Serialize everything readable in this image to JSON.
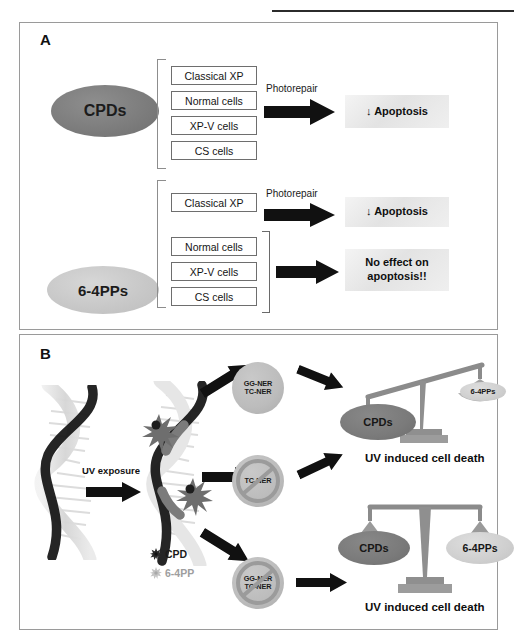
{
  "figure": {
    "header_note": "",
    "panel_a": {
      "letter": "A",
      "row1": {
        "source_label": "CPDs",
        "cells": [
          "Classical  XP",
          "Normal cells",
          "XP-V cells",
          "CS cells"
        ],
        "process_label": "Photorepair",
        "outcome": "↓ Apoptosis",
        "arrow_icon": "right-block-arrow-icon"
      },
      "row2": {
        "source_label": "6-4PPs",
        "top_group": {
          "cells": [
            "Classical  XP"
          ],
          "process_label": "Photorepair",
          "outcome": "↓ Apoptosis"
        },
        "bottom_group": {
          "cells": [
            "Normal cells",
            "XP-V cells",
            "CS cells"
          ],
          "outcome_line1": "No effect on",
          "outcome_line2": "apoptosis!!"
        }
      }
    },
    "panel_b": {
      "letter": "B",
      "uv_label": "UV exposure",
      "legend": [
        {
          "marker": "dark-burst-icon",
          "label": "CPD"
        },
        {
          "marker": "light-burst-icon",
          "label": "6-4PP"
        }
      ],
      "branches": [
        {
          "repair_lines": [
            "GG-NER",
            "TC-NER"
          ],
          "blocked": false,
          "outcome_caption": "UV induced cell death",
          "balance": {
            "tilt": "left-down",
            "left_pan": "CPDs",
            "right_pan": "6-4PPs"
          }
        },
        {
          "repair_lines": [
            "TC-NER"
          ],
          "blocked": true,
          "outcome_caption": "",
          "balance": null
        },
        {
          "repair_lines": [
            "GG-NER",
            "TC-NER"
          ],
          "blocked": true,
          "outcome_caption": "UV induced cell death",
          "balance": {
            "tilt": "level",
            "left_pan": "CPDs",
            "right_pan": "6-4PPs"
          }
        }
      ]
    }
  },
  "colors": {
    "ink": "#111111",
    "panel_border": "#9a9a9a",
    "ellipse_dark": "#7d7d7d",
    "ellipse_light": "#c8c8c8",
    "ner_circle": "#bcbcbc",
    "arrow_black": "#111111",
    "outcome_bg": "#e8e8e8",
    "scale_gray": "#7a7a7a"
  }
}
